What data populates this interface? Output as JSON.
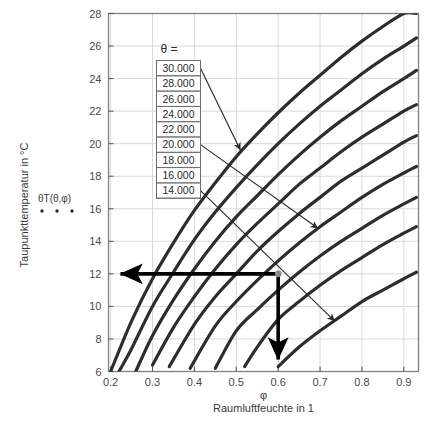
{
  "chart_data": {
    "type": "line",
    "title": "",
    "xlabel": "Raumluftfeuchte in 1",
    "xsymbol": "φ",
    "ylabel": "Taupunkttemperatur in °C",
    "ysymbol": "θT",
    "xlim": [
      0.195,
      0.935
    ],
    "ylim": [
      6,
      28
    ],
    "xticks": [
      0.2,
      0.3,
      0.4,
      0.5,
      0.6,
      0.7,
      0.8,
      0.9
    ],
    "xtick_labels": [
      "0.2",
      "0.3",
      "0.4",
      "0.5",
      "0.6",
      "0.7",
      "0.8",
      "0.9"
    ],
    "yticks": [
      6,
      8,
      10,
      12,
      14,
      16,
      18,
      20,
      22,
      24,
      26,
      28
    ],
    "ytick_labels": [
      "6",
      "8",
      "10",
      "12",
      "14",
      "16",
      "18",
      "20",
      "22",
      "24",
      "26",
      "28"
    ],
    "grid": true,
    "legend_position": "inside-upper-left",
    "legend_title": "θ  =",
    "series": [
      {
        "name": "30.000",
        "theta": 30,
        "x": [
          0.2,
          0.25,
          0.3,
          0.35,
          0.4,
          0.45,
          0.5,
          0.55,
          0.6,
          0.65,
          0.7,
          0.75,
          0.8,
          0.85,
          0.9,
          0.93
        ],
        "y": [
          6.0,
          9.1,
          11.7,
          13.9,
          15.9,
          17.6,
          19.2,
          20.6,
          21.9,
          23.1,
          24.2,
          25.3,
          26.3,
          27.2,
          28.0,
          28.0
        ]
      },
      {
        "name": "28.000",
        "theta": 28,
        "x": [
          0.22,
          0.25,
          0.3,
          0.35,
          0.4,
          0.45,
          0.5,
          0.55,
          0.6,
          0.65,
          0.7,
          0.75,
          0.8,
          0.85,
          0.9,
          0.93
        ],
        "y": [
          6.0,
          7.4,
          10.0,
          12.1,
          14.1,
          15.8,
          17.3,
          18.7,
          20.0,
          21.2,
          22.3,
          23.3,
          24.3,
          25.2,
          26.0,
          26.5
        ]
      },
      {
        "name": "26.000",
        "theta": 26,
        "x": [
          0.26,
          0.3,
          0.35,
          0.4,
          0.45,
          0.5,
          0.55,
          0.6,
          0.65,
          0.7,
          0.75,
          0.8,
          0.85,
          0.9,
          0.93
        ],
        "y": [
          6.0,
          8.2,
          10.4,
          12.3,
          14.0,
          15.5,
          16.8,
          18.1,
          19.3,
          20.4,
          21.4,
          22.3,
          23.2,
          24.0,
          24.5
        ]
      },
      {
        "name": "24.000",
        "theta": 24,
        "x": [
          0.3,
          0.35,
          0.4,
          0.45,
          0.5,
          0.55,
          0.6,
          0.65,
          0.7,
          0.75,
          0.8,
          0.85,
          0.9,
          0.93
        ],
        "y": [
          6.4,
          8.7,
          10.6,
          12.3,
          13.8,
          15.1,
          16.3,
          17.5,
          18.5,
          19.5,
          20.4,
          21.2,
          22.0,
          22.4
        ]
      },
      {
        "name": "22.000",
        "theta": 22,
        "x": [
          0.34,
          0.4,
          0.45,
          0.5,
          0.55,
          0.6,
          0.65,
          0.7,
          0.75,
          0.8,
          0.85,
          0.9,
          0.93
        ],
        "y": [
          6.3,
          8.9,
          10.6,
          12.0,
          13.4,
          14.6,
          15.7,
          16.7,
          17.7,
          18.5,
          19.3,
          20.1,
          20.5
        ]
      },
      {
        "name": "20.000",
        "theta": 20,
        "x": [
          0.39,
          0.45,
          0.5,
          0.55,
          0.6,
          0.65,
          0.7,
          0.75,
          0.8,
          0.85,
          0.9,
          0.93
        ],
        "y": [
          6.2,
          8.8,
          10.3,
          11.6,
          12.8,
          13.9,
          14.9,
          15.8,
          16.7,
          17.5,
          18.2,
          18.6
        ]
      },
      {
        "name": "18.000",
        "theta": 18,
        "x": [
          0.45,
          0.5,
          0.55,
          0.6,
          0.65,
          0.7,
          0.75,
          0.8,
          0.85,
          0.9,
          0.93
        ],
        "y": [
          6.2,
          8.5,
          9.8,
          11.0,
          12.1,
          13.1,
          14.0,
          14.8,
          15.6,
          16.3,
          16.7
        ]
      },
      {
        "name": "16.000",
        "theta": 16,
        "x": [
          0.52,
          0.55,
          0.6,
          0.65,
          0.7,
          0.75,
          0.8,
          0.85,
          0.9,
          0.93
        ],
        "y": [
          6.3,
          7.5,
          9.2,
          10.3,
          11.3,
          12.2,
          13.0,
          13.8,
          14.5,
          14.9
        ]
      },
      {
        "name": "14.000",
        "theta": 14,
        "x": [
          0.6,
          0.65,
          0.7,
          0.75,
          0.8,
          0.85,
          0.9,
          0.93
        ],
        "y": [
          6.3,
          7.5,
          8.5,
          9.4,
          10.3,
          11.0,
          11.7,
          12.1
        ]
      }
    ],
    "construction": {
      "phi": 0.6,
      "dewpoint": 12,
      "description": "horizontal arrow from (0.6, 12) to y-axis; vertical arrow from (0.6, 12) to x-axis"
    },
    "callouts": [
      {
        "label": "30.000",
        "target_x": 0.51,
        "target_y": 19.6
      },
      {
        "label": "20.000",
        "target_x": 0.695,
        "target_y": 14.8
      },
      {
        "label": "14.000",
        "target_x": 0.735,
        "target_y": 9.1
      }
    ]
  },
  "axes": {
    "y_axis_title": "Taupunkttemperatur in °C",
    "x_axis_title": "Raumluftfeuchte in 1",
    "x_axis_symbol": "φ",
    "series_annotation": "θT(θ,φ)"
  },
  "legend": {
    "title": "θ  =",
    "entries": [
      "30.000",
      "28.000",
      "26.000",
      "24.000",
      "22.000",
      "20.000",
      "18.000",
      "16.000",
      "14.000"
    ]
  },
  "colors": {
    "curve": "#2d2d2d",
    "grid": "#d9d9d9",
    "frame": "#808080",
    "text": "#3a3a3a",
    "construction": "#000000"
  }
}
